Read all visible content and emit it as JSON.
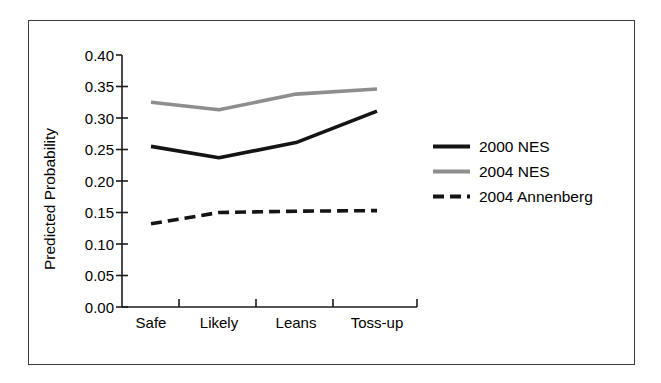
{
  "chart_data": {
    "type": "line",
    "title": "",
    "subtitle": "",
    "xlabel": "",
    "ylabel": "Predicted Probability",
    "categories": [
      "Safe",
      "Likely",
      "Leans",
      "Toss-up"
    ],
    "ylim": [
      0.0,
      0.4
    ],
    "ytick_labels": [
      "0.00",
      "0.05",
      "0.10",
      "0.15",
      "0.20",
      "0.25",
      "0.30",
      "0.35",
      "0.40"
    ],
    "ytick_values": [
      0.0,
      0.05,
      0.1,
      0.15,
      0.2,
      0.25,
      0.3,
      0.35,
      0.4
    ],
    "grid": false,
    "legend_position": "right",
    "series": [
      {
        "name": "2000 NES",
        "style": "solid",
        "color": "#141414",
        "values": [
          0.255,
          0.237,
          0.261,
          0.311
        ]
      },
      {
        "name": "2004 NES",
        "style": "solid",
        "color": "#8e8e8e",
        "values": [
          0.325,
          0.313,
          0.338,
          0.346
        ]
      },
      {
        "name": "2004 Annenberg",
        "style": "dashed",
        "color": "#141414",
        "values": [
          0.132,
          0.15,
          0.152,
          0.153
        ]
      }
    ]
  },
  "axis": {
    "y_title": "Predicted Probability"
  },
  "legend": {
    "entries": [
      {
        "label": "2000 NES"
      },
      {
        "label": "2004 NES"
      },
      {
        "label": "2004 Annenberg"
      }
    ]
  }
}
